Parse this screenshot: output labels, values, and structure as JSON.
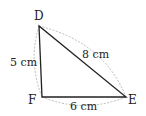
{
  "diagram": {
    "type": "triangle",
    "vertices": [
      {
        "name": "D",
        "label": "D"
      },
      {
        "name": "F",
        "label": "F"
      },
      {
        "name": "E",
        "label": "E"
      }
    ],
    "sides": [
      {
        "from": "D",
        "to": "F",
        "length_label": "5 cm"
      },
      {
        "from": "D",
        "to": "E",
        "length_label": "8 cm"
      },
      {
        "from": "F",
        "to": "E",
        "length_label": "6 cm"
      }
    ],
    "colors": {
      "edge": "#222222",
      "arc": "#aaaaaa",
      "text": "#222222"
    }
  }
}
